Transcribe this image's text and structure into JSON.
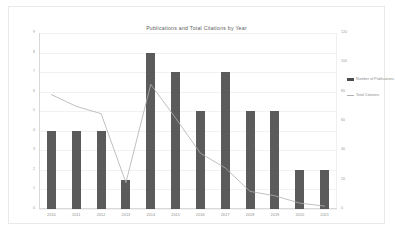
{
  "chart_data": {
    "type": "bar",
    "title": "Publications and Total Citations by Year",
    "xlabel": "",
    "ylabel": "",
    "categories": [
      "2010",
      "2011",
      "2012",
      "2013",
      "2014",
      "2015",
      "2016",
      "2017",
      "2018",
      "2019",
      "2020",
      "2021"
    ],
    "series": [
      {
        "name": "Number of Publications",
        "type": "bar",
        "axis": "left",
        "values": [
          4,
          4,
          4,
          1.5,
          8,
          7,
          5,
          7,
          5,
          5,
          2,
          2
        ],
        "color": "#4d4d4d"
      },
      {
        "name": "Total Citations",
        "type": "line",
        "axis": "right",
        "values": [
          78,
          70,
          65,
          18,
          85,
          62,
          38,
          28,
          12,
          9,
          4,
          2
        ],
        "color": "#b0b0b0"
      }
    ],
    "ylim": [
      0,
      9
    ],
    "y2lim": [
      0,
      120
    ],
    "yticks": [
      "0",
      "1",
      "2",
      "3",
      "4",
      "5",
      "6",
      "7",
      "8",
      "9"
    ],
    "y2ticks": [
      "0",
      "20",
      "40",
      "60",
      "80",
      "100",
      "120"
    ],
    "grid": true,
    "legend_position": "right"
  },
  "legend": {
    "items": [
      {
        "label": "Number of Publications",
        "marker": "bar-swatch"
      },
      {
        "label": "Total Citations",
        "marker": "line-swatch"
      }
    ]
  }
}
